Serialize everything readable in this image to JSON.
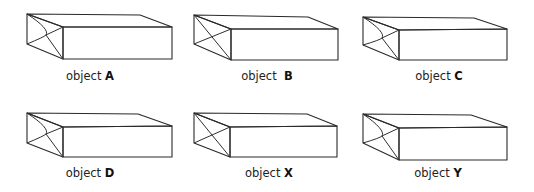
{
  "figure": {
    "background": "#ffffff",
    "colors": {
      "top_face_light": "#d9d9d9",
      "top_face_dark": "#b4b4b4",
      "front_face_light": "#ebebeb",
      "front_face_dark": "#a8a8a8",
      "side_face_light": "#c4c4c4",
      "side_face_dark": "#8f8f8f",
      "edge": "#2a2a2a"
    },
    "objects": [
      {
        "id": "A",
        "prefix": "object",
        "letter": "A",
        "gap": " ",
        "label_x": 90,
        "label_y": 80,
        "tl": [
          27,
          14
        ],
        "tbr": [
          140,
          15
        ],
        "rc": [
          172,
          27
        ],
        "ftl": [
          63,
          27
        ],
        "fbl": [
          63,
          59
        ],
        "fbr": [
          172,
          59
        ],
        "lb": [
          27,
          44
        ],
        "fold": "kinked",
        "fold_mid": [
          46,
          35
        ]
      },
      {
        "id": "B",
        "prefix": "object",
        "letter": "B",
        "gap": "  ",
        "label_x": 267,
        "label_y": 80,
        "tl": [
          194,
          15
        ],
        "tbr": [
          308,
          17
        ],
        "rc": [
          338,
          29
        ],
        "ftl": [
          231,
          29
        ],
        "fbl": [
          231,
          60
        ],
        "fbr": [
          338,
          60
        ],
        "lb": [
          194,
          44
        ],
        "fold": "cross",
        "fold_mid": [
          212,
          37
        ]
      },
      {
        "id": "C",
        "prefix": "object",
        "letter": "C",
        "gap": " ",
        "label_x": 439,
        "label_y": 80,
        "tl": [
          363,
          17
        ],
        "tbr": [
          474,
          18
        ],
        "rc": [
          507,
          29
        ],
        "ftl": [
          399,
          30
        ],
        "fbl": [
          399,
          60
        ],
        "fbr": [
          507,
          60
        ],
        "lb": [
          363,
          45
        ],
        "fold": "kinked",
        "fold_mid": [
          382,
          38
        ]
      },
      {
        "id": "D",
        "prefix": "object",
        "letter": "D",
        "gap": " ",
        "label_x": 90,
        "label_y": 177,
        "tl": [
          27,
          113
        ],
        "tbr": [
          138,
          114
        ],
        "rc": [
          172,
          126
        ],
        "ftl": [
          63,
          127
        ],
        "fbl": [
          63,
          157
        ],
        "fbr": [
          172,
          157
        ],
        "lb": [
          27,
          143
        ],
        "fold": "kinked",
        "fold_mid": [
          46,
          134
        ]
      },
      {
        "id": "X",
        "prefix": "object",
        "letter": "X",
        "gap": " ",
        "label_x": 269,
        "label_y": 177,
        "tl": [
          194,
          113
        ],
        "tbr": [
          307,
          114
        ],
        "rc": [
          337,
          126
        ],
        "ftl": [
          230,
          127
        ],
        "fbl": [
          230,
          157
        ],
        "fbr": [
          337,
          157
        ],
        "lb": [
          194,
          143
        ],
        "fold": "cross",
        "fold_mid": [
          212,
          135
        ]
      },
      {
        "id": "Y",
        "prefix": "object",
        "letter": "Y",
        "gap": " ",
        "label_x": 438,
        "label_y": 177,
        "tl": [
          363,
          114
        ],
        "tbr": [
          471,
          115
        ],
        "rc": [
          507,
          127
        ],
        "ftl": [
          399,
          128
        ],
        "fbl": [
          399,
          160
        ],
        "fbr": [
          507,
          160
        ],
        "lb": [
          363,
          143
        ],
        "fold": "kinked",
        "fold_mid": [
          382,
          136
        ]
      }
    ]
  }
}
